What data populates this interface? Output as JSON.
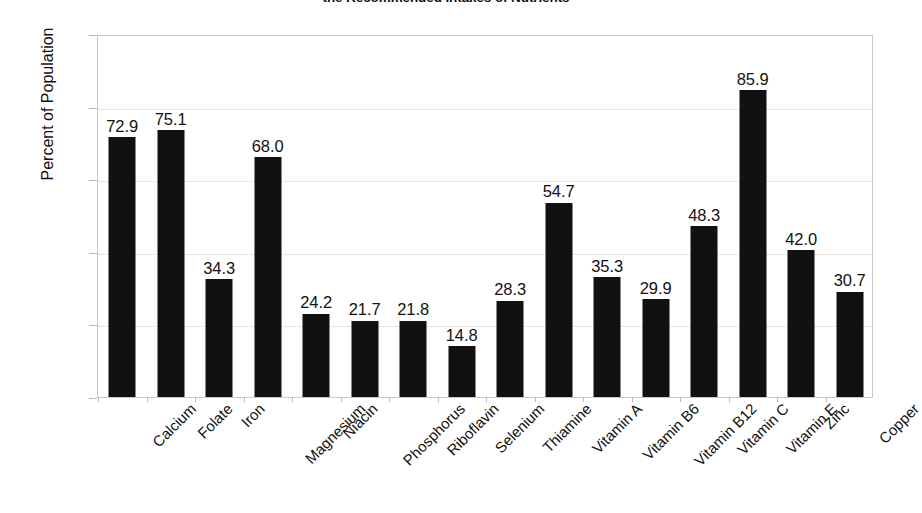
{
  "chart_data": {
    "type": "bar",
    "title": "the Recommended Intakes of Nutrients",
    "xlabel": "",
    "ylabel": "Percent of Population",
    "ylim": [
      0,
      100
    ],
    "ytick_values": [
      0,
      20,
      40,
      60,
      80,
      100
    ],
    "ytick_labels": [
      "0",
      "20",
      "40",
      "60",
      "80",
      "100"
    ],
    "grid": true,
    "grid_axis": "y",
    "legend": false,
    "bar_color": "#111111",
    "categories": [
      "Calcium",
      "Folate",
      "Iron",
      "Magnesium",
      "Niacin",
      "Phosphorus",
      "Riboflavin",
      "Selenium",
      "Thiamine",
      "Vitamin A",
      "Vitamin B6",
      "Vitamin B12",
      "Vitamin C",
      "Vitamin E",
      "Zinc",
      "Copper"
    ],
    "values": [
      72.9,
      75.1,
      34.3,
      68.0,
      24.2,
      21.7,
      21.8,
      14.8,
      28.3,
      54.7,
      35.3,
      29.9,
      48.3,
      85.9,
      42.0,
      30.7
    ],
    "value_labels": [
      "72.9",
      "75.1",
      "34.3",
      "68.0",
      "24.2",
      "21.7",
      "21.8",
      "14.8",
      "28.3",
      "54.7",
      "35.3",
      "29.9",
      "48.3",
      "85.9",
      "42.0",
      "30.7"
    ],
    "bar_pixel_values": [
      71.5,
      73.5,
      32.5,
      66.0,
      23.0,
      21.0,
      21.0,
      14.0,
      26.5,
      53.5,
      33.0,
      27.0,
      47.0,
      84.5,
      40.5,
      29.0
    ]
  }
}
